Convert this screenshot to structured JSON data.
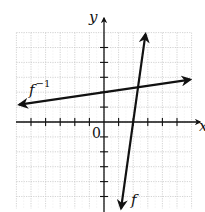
{
  "chart_data": {
    "type": "line",
    "title": "",
    "xlabel": "x",
    "ylabel": "y",
    "origin_label": "0",
    "xlim": [
      -6,
      6
    ],
    "ylim": [
      -6,
      6
    ],
    "grid": true,
    "grid_style": "dotted",
    "tick_spacing": 1,
    "x_ticks": [
      -5,
      -4,
      -3,
      -2,
      -1,
      1,
      2,
      3,
      4,
      5
    ],
    "y_ticks": [
      -5,
      -4,
      -3,
      -2,
      -1,
      1,
      2,
      3,
      4,
      5
    ],
    "series": [
      {
        "name": "f",
        "label": "f",
        "equation": "y = 7x - 14",
        "x": [
          1.17,
          2.84
        ],
        "y": [
          -5.8,
          5.9
        ],
        "arrows": "both",
        "color": "#111111"
      },
      {
        "name": "f_inverse",
        "label": "f",
        "label_superscript": "−1",
        "equation": "y = x/7 + 2",
        "x": [
          -5.8,
          5.9
        ],
        "y": [
          1.17,
          2.84
        ],
        "arrows": "both",
        "color": "#111111"
      }
    ],
    "intersection": {
      "x": 2.33,
      "y": 2.33
    }
  },
  "colors": {
    "axis": "#111111",
    "grid": "#c8c8c8",
    "background": "#ffffff"
  }
}
